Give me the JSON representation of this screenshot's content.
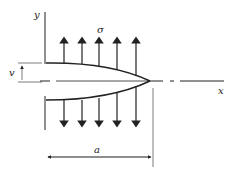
{
  "diagram": {
    "axes": {
      "x_label": "x",
      "y_label": "y"
    },
    "stress_label": "σ",
    "opening_label": "v",
    "crack_length_label": "a",
    "arrows": {
      "up_count": 5,
      "down_count": 5
    },
    "colors": {
      "stroke": "#222222",
      "background": "#ffffff"
    }
  }
}
